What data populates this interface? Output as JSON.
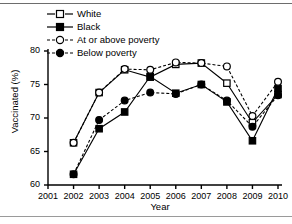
{
  "chart_data": {
    "type": "line",
    "title": "",
    "xlabel": "Year",
    "ylabel": "Vaccinated (%)",
    "xlim": [
      2001,
      2010
    ],
    "ylim": [
      60,
      80
    ],
    "xticks": [
      "2001",
      "2002",
      "2003",
      "2004",
      "2005",
      "2006",
      "2007",
      "2008",
      "2009",
      "2010"
    ],
    "yticks": [
      "60",
      "65",
      "70",
      "75",
      "80"
    ],
    "grid": false,
    "legend_position": "top-left",
    "x": [
      2002,
      2003,
      2004,
      2005,
      2006,
      2007,
      2008,
      2009,
      2010
    ],
    "series": [
      {
        "name": "White",
        "marker": "open-square",
        "line": "solid",
        "color": "#000000",
        "values": [
          66.3,
          73.8,
          77.2,
          76.1,
          78.0,
          78.2,
          75.2,
          69.3,
          73.5
        ]
      },
      {
        "name": "Black",
        "marker": "filled-square",
        "line": "solid",
        "color": "#000000",
        "values": [
          61.6,
          68.4,
          70.9,
          76.2,
          73.7,
          75.0,
          72.4,
          66.6,
          74.4
        ]
      },
      {
        "name": "At or above poverty",
        "marker": "open-circle",
        "line": "dashed",
        "color": "#000000",
        "values": [
          66.3,
          73.8,
          77.3,
          77.2,
          78.3,
          78.2,
          77.7,
          70.3,
          75.4
        ]
      },
      {
        "name": "Below poverty",
        "marker": "filled-circle",
        "line": "dashed",
        "color": "#000000",
        "values": [
          61.6,
          69.7,
          72.6,
          73.8,
          73.6,
          75.0,
          72.6,
          68.7,
          73.4
        ]
      }
    ]
  },
  "legend": {
    "items": [
      {
        "label": "White"
      },
      {
        "label": "Black"
      },
      {
        "label": "At or above poverty"
      },
      {
        "label": "Below poverty"
      }
    ]
  },
  "axes": {
    "ylabel": "Vaccinated (%)",
    "xlabel": "Year",
    "yticks": [
      "80",
      "75",
      "70",
      "65",
      "60"
    ],
    "xticks": [
      "2001",
      "2002",
      "2003",
      "2004",
      "2005",
      "2006",
      "2007",
      "2008",
      "2009",
      "2010"
    ]
  }
}
